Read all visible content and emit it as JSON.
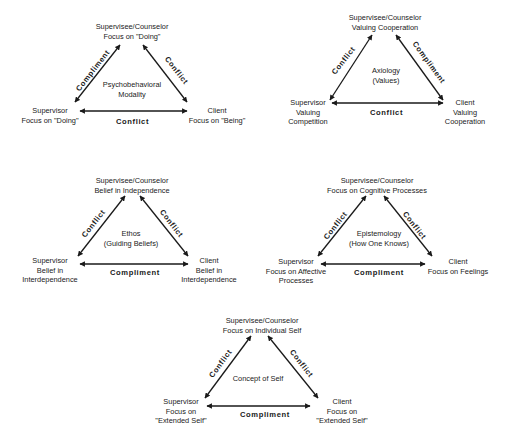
{
  "diagrams": [
    {
      "concept": [
        "Psychobehavioral",
        "Modality"
      ],
      "top": [
        "Supervisee/Counselor",
        "Focus on \"Doing\""
      ],
      "left": [
        "Supervisor",
        "Focus on \"Doing\""
      ],
      "right": [
        "Client",
        "Focus on \"Being\""
      ],
      "left_edge": "Compliment",
      "right_edge": "Conflict",
      "bottom_edge": "Conflict"
    },
    {
      "concept": [
        "Axiology",
        "(Values)"
      ],
      "top": [
        "Supervisee/Counselor",
        "Valuing Cooperation"
      ],
      "left": [
        "Supervisor",
        "Valuing",
        "Competition"
      ],
      "right": [
        "Client",
        "Valuing",
        "Cooperation"
      ],
      "left_edge": "Conflict",
      "right_edge": "Compliment",
      "bottom_edge": "Conflict"
    },
    {
      "concept": [
        "Ethos",
        "(Guiding Beliefs)"
      ],
      "top": [
        "Supervisee/Counselor",
        "Belief in Independence"
      ],
      "left": [
        "Supervisor",
        "Belief in",
        "Interdependence"
      ],
      "right": [
        "Client",
        "Belief in",
        "Interdependence"
      ],
      "left_edge": "Conflict",
      "right_edge": "Conflict",
      "bottom_edge": "Compliment"
    },
    {
      "concept": [
        "Epistemology",
        "(How One Knows)"
      ],
      "top": [
        "Supervisee/Counselor",
        "Focus on Cognitive Processes"
      ],
      "left": [
        "Supervisor",
        "Focus on Affective",
        "Processes"
      ],
      "right": [
        "Client",
        "Focus on Feelings"
      ],
      "left_edge": "Conflict",
      "right_edge": "Conflict",
      "bottom_edge": "Compliment"
    },
    {
      "concept": [
        "Concept of Self"
      ],
      "top": [
        "Supervisee/Counselor",
        "Focus on Individual Self"
      ],
      "left": [
        "Supervisor",
        "Focus on",
        "\"Extended Self\""
      ],
      "right": [
        "Client",
        "Focus on",
        "\"Extended Self\""
      ],
      "left_edge": "Conflict",
      "right_edge": "Conflict",
      "bottom_edge": "Compliment"
    }
  ],
  "colors": {
    "ink": "#1a1a1a",
    "background": "#ffffff"
  }
}
